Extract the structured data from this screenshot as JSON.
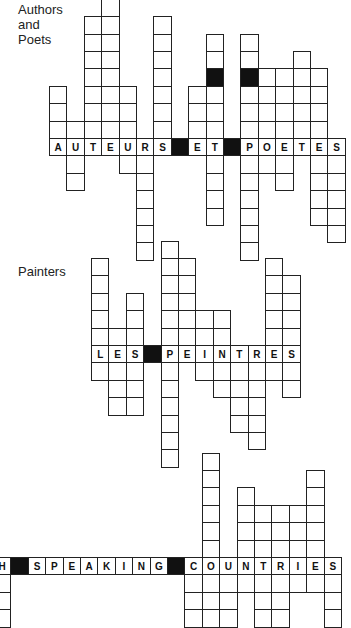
{
  "labels": {
    "authors": "Authors\nand\nPoets",
    "authors_lines": [
      "Authors",
      "and",
      "Poets"
    ],
    "painters": "Painters"
  },
  "cell_size": 17.4,
  "puzzles": [
    {
      "name": "authors-and-poets",
      "theme": "Authors and Poets",
      "word": "AUTEURS ET POETES",
      "origin_x": 49,
      "word_row_y": 138,
      "columns": [
        {
          "letter": "A",
          "up": 3,
          "down": 0
        },
        {
          "letter": "U",
          "up": 1,
          "down": 2
        },
        {
          "letter": "T",
          "up": 7,
          "down": 0
        },
        {
          "letter": "E",
          "up": 8,
          "down": 0
        },
        {
          "letter": "U",
          "up": 3,
          "down": 1
        },
        {
          "letter": "R",
          "up": 0,
          "down": 6
        },
        {
          "letter": "S",
          "up": 7,
          "down": 0
        },
        {
          "letter": "",
          "black": true,
          "up": 0,
          "down": 0
        },
        {
          "letter": "E",
          "up": 3,
          "down": 0
        },
        {
          "letter": "T",
          "up": 6,
          "down": 4,
          "black_up": [
            4
          ]
        },
        {
          "letter": "",
          "black": true,
          "up": 0,
          "down": 0
        },
        {
          "letter": "P",
          "up": 6,
          "down": 6,
          "black_up": [
            4
          ]
        },
        {
          "letter": "O",
          "up": 4,
          "down": 1
        },
        {
          "letter": "E",
          "up": 4,
          "down": 2
        },
        {
          "letter": "T",
          "up": 5,
          "down": 0
        },
        {
          "letter": "E",
          "up": 4,
          "down": 4
        },
        {
          "letter": "S",
          "up": 0,
          "down": 5
        }
      ]
    },
    {
      "name": "painters",
      "theme": "Painters",
      "word": "LES PEINTRES",
      "origin_x": 91,
      "word_row_y": 345,
      "columns": [
        {
          "letter": "L",
          "up": 5,
          "down": 1
        },
        {
          "letter": "E",
          "up": 1,
          "down": 3
        },
        {
          "letter": "S",
          "up": 3,
          "down": 3
        },
        {
          "letter": "",
          "black": true,
          "up": 0,
          "down": 0
        },
        {
          "letter": "P",
          "up": 6,
          "down": 6
        },
        {
          "letter": "E",
          "up": 5,
          "down": 0
        },
        {
          "letter": "I",
          "up": 2,
          "down": 1
        },
        {
          "letter": "N",
          "up": 2,
          "down": 2
        },
        {
          "letter": "T",
          "up": 0,
          "down": 4
        },
        {
          "letter": "R",
          "up": 0,
          "down": 5
        },
        {
          "letter": "E",
          "up": 5,
          "down": 1
        },
        {
          "letter": "S",
          "up": 4,
          "down": 2
        }
      ]
    },
    {
      "name": "english-speaking-countries",
      "theme": "English Speaking Countries",
      "word": "H SPEAKING COUNTRIES",
      "origin_x": -7,
      "word_row_y": 557,
      "columns": [
        {
          "letter": "H",
          "up": 0,
          "down": 3
        },
        {
          "letter": "",
          "black": true,
          "up": 0,
          "down": 0
        },
        {
          "letter": "S",
          "up": 0,
          "down": 0
        },
        {
          "letter": "P",
          "up": 0,
          "down": 0
        },
        {
          "letter": "E",
          "up": 0,
          "down": 0
        },
        {
          "letter": "A",
          "up": 0,
          "down": 0
        },
        {
          "letter": "K",
          "up": 0,
          "down": 0
        },
        {
          "letter": "I",
          "up": 0,
          "down": 0
        },
        {
          "letter": "N",
          "up": 0,
          "down": 0
        },
        {
          "letter": "G",
          "up": 0,
          "down": 0
        },
        {
          "letter": "",
          "black": true,
          "up": 0,
          "down": 0
        },
        {
          "letter": "C",
          "up": 0,
          "down": 3
        },
        {
          "letter": "O",
          "up": 6,
          "down": 3
        },
        {
          "letter": "U",
          "up": 0,
          "down": 3
        },
        {
          "letter": "N",
          "up": 4,
          "down": 1
        },
        {
          "letter": "T",
          "up": 3,
          "down": 3
        },
        {
          "letter": "R",
          "up": 3,
          "down": 3
        },
        {
          "letter": "I",
          "up": 3,
          "down": 1
        },
        {
          "letter": "E",
          "up": 5,
          "down": 1
        },
        {
          "letter": "S",
          "up": 0,
          "down": 3
        }
      ]
    }
  ]
}
